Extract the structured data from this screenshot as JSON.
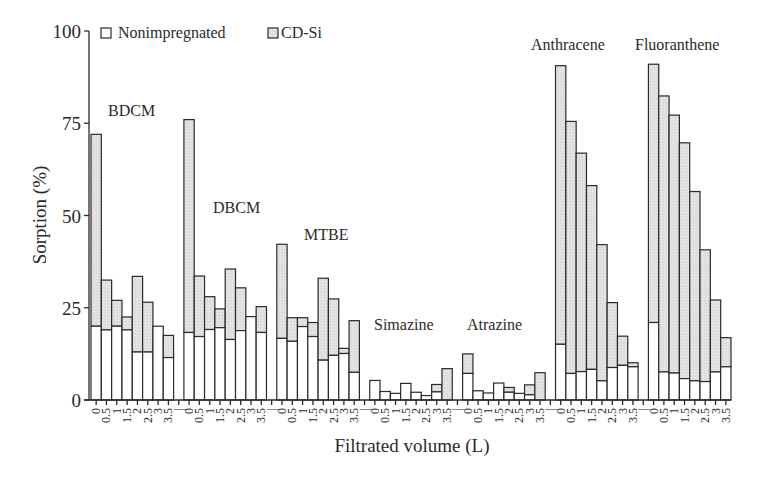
{
  "chart_data": {
    "type": "bar",
    "stacked": true,
    "title": "",
    "xlabel": "Filtrated volume (L)",
    "ylabel": "Sorption (%)",
    "ylim": [
      0,
      100
    ],
    "yticks": [
      0,
      25,
      50,
      75,
      100
    ],
    "grid": false,
    "legend": {
      "position": "top-left",
      "entries": [
        {
          "label": "Nonimpregnated",
          "color": "#ffffff"
        },
        {
          "label": "CD-Si",
          "color": "#e2e2e2"
        }
      ]
    },
    "categories": [
      "0",
      "0.5",
      "1",
      "1.5",
      "2",
      "2.5",
      "3",
      "3.5"
    ],
    "group_separator_label": "|",
    "groups": [
      {
        "name": "BDCM",
        "nonimpregnated": [
          20,
          19,
          20,
          19,
          13,
          13,
          20,
          11.5
        ],
        "cd_si_total": [
          72,
          32.5,
          27,
          22.5,
          33.5,
          26.5,
          20,
          17.5
        ]
      },
      {
        "name": "DBCM",
        "nonimpregnated": [
          18.3,
          17.2,
          19.1,
          19.6,
          16.4,
          18.8,
          22.6,
          18.3
        ],
        "cd_si_total": [
          76,
          33.6,
          28,
          24.7,
          35.5,
          30.4,
          22.6,
          25.3
        ]
      },
      {
        "name": "MTBE",
        "nonimpregnated": [
          16.7,
          15.9,
          19.9,
          17.2,
          10.8,
          12.1,
          12.6,
          7.5
        ],
        "cd_si_total": [
          42.2,
          22.3,
          22.3,
          21,
          33,
          27.4,
          14,
          21.5
        ]
      },
      {
        "name": "Simazine",
        "nonimpregnated": [
          5.3,
          2.3,
          1.8,
          4.5,
          2.1,
          1.2,
          2.2,
          0
        ],
        "cd_si_total": [
          5.3,
          2.3,
          1.8,
          4.5,
          2.1,
          1.2,
          4.2,
          8.5
        ]
      },
      {
        "name": "Atrazine",
        "nonimpregnated": [
          7.2,
          2.5,
          1.9,
          4.6,
          2.1,
          1.8,
          1.4,
          0
        ],
        "cd_si_total": [
          12.5,
          2.5,
          1.9,
          4.6,
          3.4,
          1.8,
          4.1,
          7.4
        ]
      },
      {
        "name": "Anthracene",
        "nonimpregnated": [
          15.1,
          7.2,
          7.7,
          8.3,
          5.2,
          8.8,
          9.4,
          9.0
        ],
        "cd_si_total": [
          90.6,
          75.5,
          66.9,
          58.1,
          42.1,
          26.4,
          17.3,
          10.1
        ]
      },
      {
        "name": "Fluoranthene",
        "nonimpregnated": [
          21.0,
          7.6,
          7.3,
          5.8,
          5.2,
          5.0,
          7.6,
          9.0
        ],
        "cd_si_total": [
          91.0,
          82.4,
          77.2,
          69.7,
          56.5,
          40.7,
          27.1,
          16.9
        ]
      }
    ],
    "group_label_positions": [
      {
        "name": "BDCM",
        "x": 108,
        "y": 116
      },
      {
        "name": "DBCM",
        "x": 213,
        "y": 213
      },
      {
        "name": "MTBE",
        "x": 304,
        "y": 240
      },
      {
        "name": "Simazine",
        "x": 374,
        "y": 330
      },
      {
        "name": "Atrazine",
        "x": 467,
        "y": 330
      },
      {
        "name": "Anthracene",
        "x": 531,
        "y": 50
      },
      {
        "name": "Fluoranthene",
        "x": 635,
        "y": 50
      }
    ],
    "colors": {
      "stroke": "#2a2a2a",
      "nonimpregnated": "#ffffff",
      "cd_si": "#e2e2e2"
    }
  }
}
